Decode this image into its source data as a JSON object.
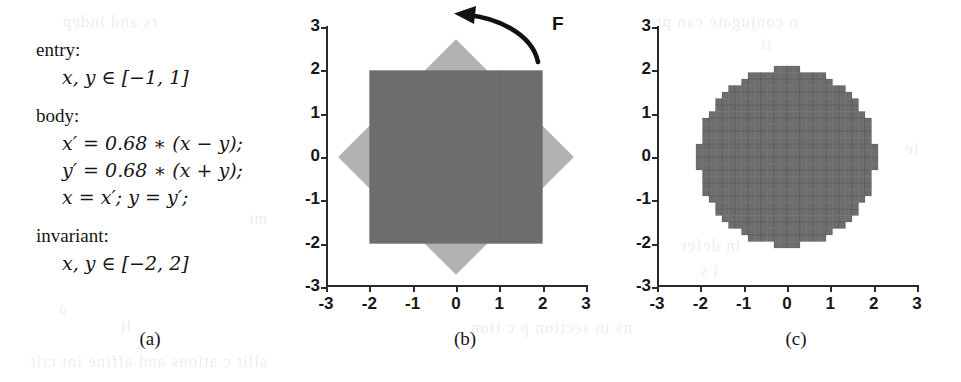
{
  "figure": {
    "panels": [
      {
        "id": "a",
        "caption": "(a)"
      },
      {
        "id": "b",
        "caption": "(b)"
      },
      {
        "id": "c",
        "caption": "(c)"
      }
    ]
  },
  "program": {
    "entry_label": "entry:",
    "entry_constraint": "x, y ∈ [−1, 1]",
    "body_label": "body:",
    "body_lines": [
      "x′ = 0.68 ∗ (x − y);",
      "y′ = 0.68 ∗ (x + y);",
      "x = x′; y = y′;"
    ],
    "invariant_label": "invariant:",
    "invariant_constraint": "x, y ∈ [−2, 2]"
  },
  "plot_b": {
    "annotation_label": "F",
    "colors": {
      "square_fill": "#6d6d6d",
      "diamond_fill": "#b2b2b2",
      "axis": "#2a2a2a",
      "arrow": "#121212"
    }
  },
  "plot_c": {
    "colors": {
      "region_fill": "#6d6d6d",
      "cell_edge": "#3a3a3a",
      "axis": "#2a2a2a"
    }
  },
  "axes": {
    "x_ticks": [
      "-3",
      "-2",
      "-1",
      "0",
      "1",
      "2",
      "3"
    ],
    "y_ticks": [
      "3",
      "2",
      "1",
      "0",
      "-1",
      "-2",
      "-3"
    ],
    "xlim": [
      -3,
      3
    ],
    "ylim": [
      -3,
      3
    ]
  },
  "chart_data": [
    {
      "type": "area",
      "panel": "b",
      "title": "",
      "xlabel": "",
      "ylabel": "",
      "xlim": [
        -3,
        3
      ],
      "ylim": [
        -3,
        3
      ],
      "xticks": [
        -3,
        -2,
        -1,
        0,
        1,
        2,
        3
      ],
      "yticks": [
        -3,
        -2,
        -1,
        0,
        1,
        2,
        3
      ],
      "grid": false,
      "legend": "none",
      "annotations": [
        {
          "text": "F",
          "x": 2.35,
          "y": 2.85,
          "kind": "curved-arrow-label"
        }
      ],
      "series": [
        {
          "name": "invariant-box",
          "shape": "polygon",
          "fill": "#6d6d6d",
          "points": [
            [
              -2,
              -2
            ],
            [
              2,
              -2
            ],
            [
              2,
              2
            ],
            [
              -2,
              2
            ]
          ]
        },
        {
          "name": "rotated-scaled-image",
          "shape": "polygon",
          "fill": "#b2b2b2",
          "points": [
            [
              0,
              2.72
            ],
            [
              2.72,
              0
            ],
            [
              0,
              -2.72
            ],
            [
              -2.72,
              0
            ]
          ]
        }
      ]
    },
    {
      "type": "area",
      "panel": "c",
      "title": "",
      "xlabel": "",
      "ylabel": "",
      "xlim": [
        -3,
        3
      ],
      "ylim": [
        -3,
        3
      ],
      "xticks": [
        -3,
        -2,
        -1,
        0,
        1,
        2,
        3
      ],
      "yticks": [
        -3,
        -2,
        -1,
        0,
        1,
        2,
        3
      ],
      "grid": false,
      "legend": "none",
      "series": [
        {
          "name": "gridded-invariant-disc",
          "shape": "raster-cells",
          "fill": "#6d6d6d",
          "cell_size": 0.15,
          "approximates": "disc of radius 2.05 centred at (0,0)",
          "radius": 2.05,
          "center": [
            0,
            0
          ]
        }
      ]
    }
  ],
  "ghost_text": [
    {
      "text": "rs and indep",
      "x": 62,
      "y": 12,
      "size": 17
    },
    {
      "text": "mt",
      "x": 248,
      "y": 210,
      "size": 16
    },
    {
      "text": "a",
      "x": 58,
      "y": 300,
      "size": 16
    },
    {
      "text": "li",
      "x": 120,
      "y": 318,
      "size": 16
    },
    {
      "text": "ns in section p c tion",
      "x": 470,
      "y": 318,
      "size": 17
    },
    {
      "text": "silit c ations and affine int ctit",
      "x": 30,
      "y": 352,
      "size": 17
    },
    {
      "text": "o conjugate can pr",
      "x": 655,
      "y": 12,
      "size": 17
    },
    {
      "text": "ti",
      "x": 760,
      "y": 36,
      "size": 16
    },
    {
      "text": "in defer",
      "x": 680,
      "y": 236,
      "size": 17
    },
    {
      "text": "i s",
      "x": 700,
      "y": 262,
      "size": 16
    },
    {
      "text": "ti",
      "x": 640,
      "y": 150,
      "size": 16
    },
    {
      "text": "ie",
      "x": 905,
      "y": 140,
      "size": 16
    }
  ]
}
